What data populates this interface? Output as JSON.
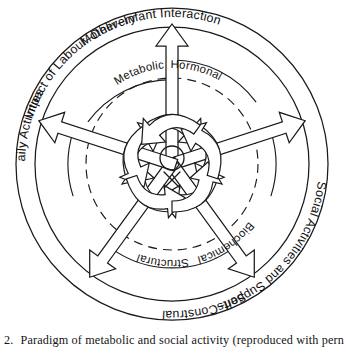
{
  "figure": {
    "title_implicit": "Paradigm of metabolic and social activity",
    "center": {
      "hub_icon": "circle-with-cross"
    },
    "outer_labels": [
      {
        "id": "impact-of-labour-delivery",
        "text": "Impact of Labour–Delivery",
        "angle_deg": -90
      },
      {
        "id": "mother-infant-interaction",
        "text": "Mother–Infant Interaction",
        "angle_deg": -18
      },
      {
        "id": "social-activities-and-supports",
        "text": "Social Activities and Supports",
        "angle_deg": 54
      },
      {
        "id": "self-construal",
        "text": "Self–Construal",
        "angle_deg": 126
      },
      {
        "id": "daily-activities",
        "text": "Daily Activities",
        "angle_deg": 198
      }
    ],
    "inner_labels": [
      {
        "id": "metabolic",
        "text": "Metabolic",
        "angle_deg": -54
      },
      {
        "id": "hormonal",
        "text": "Hormonal",
        "angle_deg": 18
      },
      {
        "id": "biochemical",
        "text": "Biochemical",
        "angle_deg": 90
      },
      {
        "id": "structural",
        "text": "Structural",
        "angle_deg": 162
      },
      {
        "id": "daily-inner-blank",
        "text": "",
        "angle_deg": 234
      }
    ],
    "colors": {
      "stroke": "#1a1a1a",
      "fill": "#ffffff",
      "background": "#ffffff",
      "text": "#111111"
    },
    "geometry": {
      "cx": 172,
      "cy": 164,
      "outer_ring_radius": 156,
      "label_band_inner_radius": 137,
      "dashed_ring_radius": 86,
      "hub_radius": 13,
      "arrow_count": 5
    }
  },
  "caption": {
    "number": "2.",
    "text": "Paradigm of metabolic and social activity (reproduced with pern"
  }
}
